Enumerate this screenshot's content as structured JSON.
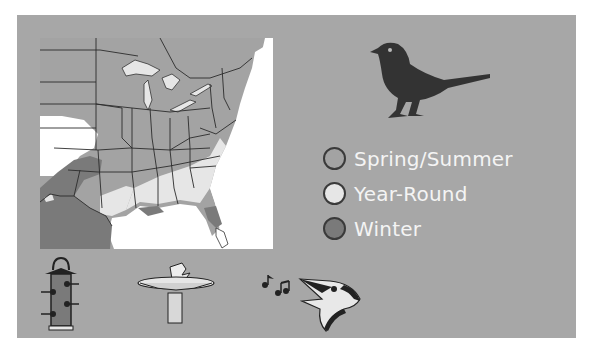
{
  "colors": {
    "panel_bg": "#a7a7a7",
    "spring_summer": "#a3a3a3",
    "year_round": "#e6e6e6",
    "winter": "#7a7a7a",
    "water": "#ffffff",
    "bird_silhouette": "#333333",
    "legend_text": "#f4f4f4"
  },
  "map": {
    "region": "Eastern United States",
    "description": "Range map showing seasonal distribution"
  },
  "legend": {
    "items": [
      {
        "label": "Spring/Summer",
        "color": "#a3a3a3"
      },
      {
        "label": "Year-Round",
        "color": "#e6e6e6"
      },
      {
        "label": "Winter",
        "color": "#7a7a7a"
      }
    ]
  },
  "icons": {
    "bird": "bird-silhouette-icon",
    "feeder": "tube-feeder-icon",
    "birdbath": "birdbath-icon",
    "song": "singing-bird-icon"
  }
}
